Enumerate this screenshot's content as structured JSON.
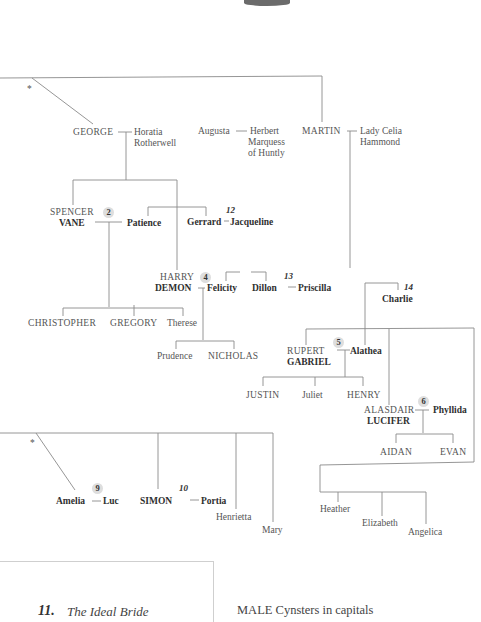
{
  "tree": {
    "generation1": {
      "george": {
        "name": "GEORGE",
        "spouse": "Horatia",
        "spouse_line2": "Rotherwell"
      },
      "augusta": {
        "name": "Augusta",
        "spouse": "Herbert",
        "spouse_line2": "Marquess",
        "spouse_line3": "of Huntly"
      },
      "martin": {
        "name": "MARTIN",
        "spouse": "Lady Celia",
        "spouse_line2": "Hammond"
      }
    },
    "george_children": {
      "spencer": {
        "first": "SPENCER",
        "nickname": "VANE",
        "book": "2",
        "spouse": "Patience"
      },
      "gerrard": {
        "name": "Gerrard",
        "spouse": "Jacqueline",
        "book": "12"
      },
      "harry": {
        "first": "HARRY",
        "nickname": "DEMON",
        "book": "4",
        "spouse": "Felicity"
      },
      "dillon": {
        "name": "Dillon",
        "spouse": "Priscilla",
        "book": "13"
      }
    },
    "vane_children": [
      "CHRISTOPHER",
      "GREGORY",
      "Therese"
    ],
    "demon_children": [
      "Prudence",
      "NICHOLAS"
    ],
    "charlie": {
      "name": "Charlie",
      "book": "14"
    },
    "martin_children": {
      "rupert": {
        "first": "RUPERT",
        "nickname": "GABRIEL",
        "book": "5",
        "spouse": "Alathea"
      },
      "alasdair": {
        "first": "ALASDAIR",
        "nickname": "LUCIFER",
        "book": "6",
        "spouse": "Phyllida"
      }
    },
    "gabriel_children": [
      "JUSTIN",
      "Juliet",
      "HENRY"
    ],
    "lucifer_children": [
      "AIDAN",
      "EVAN"
    ],
    "daughters": [
      "Heather",
      "Elizabeth",
      "Angelica"
    ],
    "lower_branch": {
      "amelia": {
        "name": "Amelia",
        "spouse": "Luc",
        "book": "9"
      },
      "simon": {
        "name": "SIMON",
        "spouse": "Portia",
        "book": "10"
      },
      "henrietta": "Henrietta",
      "mary": "Mary"
    },
    "asterisk": "*"
  },
  "footer": {
    "book_number": "11.",
    "book_title": "The Ideal Bride",
    "legend": "MALE Cynsters in capitals"
  },
  "colors": {
    "line": "#8a8a8a",
    "text": "#3a3a3a",
    "badge": "#dedede"
  }
}
